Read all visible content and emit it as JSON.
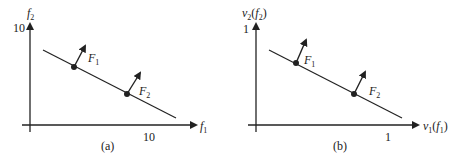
{
  "panels": [
    {
      "id": "a",
      "caption": "(a)",
      "y_axis_label": "f",
      "y_axis_sub": "2",
      "x_axis_label": "f",
      "x_axis_sub": "1",
      "y_tick": "10",
      "x_tick": "10",
      "points": [
        {
          "label": "F",
          "sub": "1"
        },
        {
          "label": "F",
          "sub": "2"
        }
      ]
    },
    {
      "id": "b",
      "caption": "(b)",
      "y_axis_label": "v",
      "y_axis_sub": "2",
      "y_axis_arg": "(f",
      "y_axis_arg_sub": "2",
      "x_axis_label": "v",
      "x_axis_sub": "1",
      "x_axis_arg": "(f",
      "x_axis_arg_sub": "1",
      "close_paren": ")",
      "y_tick": "1",
      "x_tick": "1",
      "points": [
        {
          "label": "F",
          "sub": "1"
        },
        {
          "label": "F",
          "sub": "2"
        }
      ]
    }
  ],
  "colors": {
    "ink": "#222222",
    "background": "#ffffff"
  }
}
